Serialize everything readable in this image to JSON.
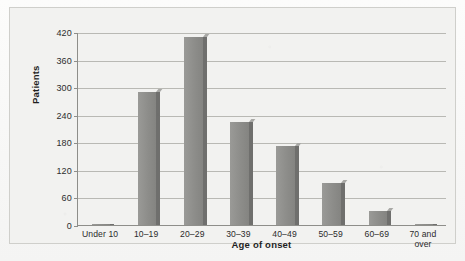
{
  "chart_data": {
    "type": "bar",
    "title": "",
    "subtitle": "",
    "xlabel": "Age of onset",
    "ylabel": "Patients",
    "categories": [
      "Under 10",
      "10–19",
      "20–29",
      "30–39",
      "40–49",
      "50–59",
      "60–69",
      "70 and\nover"
    ],
    "values": [
      2,
      290,
      410,
      225,
      172,
      92,
      30,
      3
    ],
    "ylim": [
      0,
      420
    ],
    "yticks": [
      0,
      60,
      120,
      180,
      240,
      300,
      360,
      420
    ],
    "ytick_labels": [
      "0",
      "60",
      "120",
      "180",
      "240",
      "300",
      "360",
      "420"
    ],
    "grid": "horizontal",
    "legend": "none",
    "bar_color": "#8d8d8a",
    "bar_shadow_color": "#6f6f6d",
    "gridline_color": "#b9b9b4",
    "axis_color": "#8e8e8a",
    "panel_background": "#f2f2f0",
    "page_background": "#fbfbfa"
  }
}
